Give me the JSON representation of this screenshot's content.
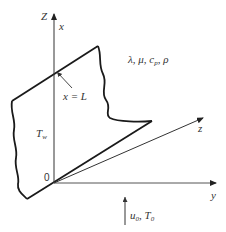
{
  "diagram": {
    "type": "schematic",
    "axes": {
      "vertical_outer_label": "Z",
      "vertical_inner_label": "x",
      "horizontal_label": "y",
      "diagonal_label": "z",
      "origin_label": "0"
    },
    "labels": {
      "plate_length": "x = L",
      "wall_temperature_main": "T",
      "wall_temperature_sub": "w",
      "properties": "λ, μ, c",
      "properties_cp_sub": "p",
      "properties_rho": ", ρ",
      "inlet_u": "u",
      "inlet_u_sub": "0",
      "inlet_sep": ", ",
      "inlet_T": "T",
      "inlet_T_sub": "0"
    },
    "colors": {
      "line": "#1a1a1a",
      "axis": "#555555",
      "text": "#333333"
    }
  }
}
